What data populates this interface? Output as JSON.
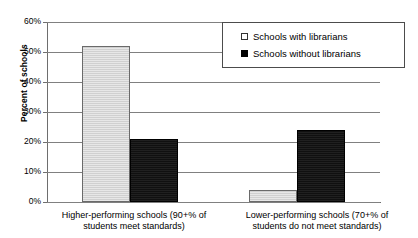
{
  "chart_data": {
    "type": "bar",
    "title": "",
    "xlabel": "",
    "ylabel": "Percent of schools",
    "ylim": [
      0,
      60
    ],
    "ytick_labels": [
      "60%",
      "50%",
      "40%",
      "30%",
      "20%",
      "10%",
      "0%"
    ],
    "ytick_values": [
      60,
      50,
      40,
      30,
      20,
      10,
      0
    ],
    "grid": true,
    "legend_position": "upper-right-inside",
    "categories": [
      "Higher-performing schools (90+%  of students meet standards)",
      "Lower-performing schools (70+% of students do not meet standards)"
    ],
    "category_lines": [
      [
        "Higher-performing schools (90+%  of",
        "students meet standards)"
      ],
      [
        "Lower-performing schools (70+% of",
        "students do not meet standards)"
      ]
    ],
    "series": [
      {
        "name": "Schools with librarians",
        "color": "#d4d4d4",
        "swatch": "light",
        "values": [
          52,
          4
        ]
      },
      {
        "name": "Schools without librarians",
        "color": "#141414",
        "swatch": "dark",
        "values": [
          21,
          24
        ]
      }
    ]
  },
  "legend": {
    "items": [
      {
        "label": "Schools with librarians"
      },
      {
        "label": "Schools without librarians"
      }
    ]
  },
  "axis": {
    "y_title": "Percent of schools"
  }
}
